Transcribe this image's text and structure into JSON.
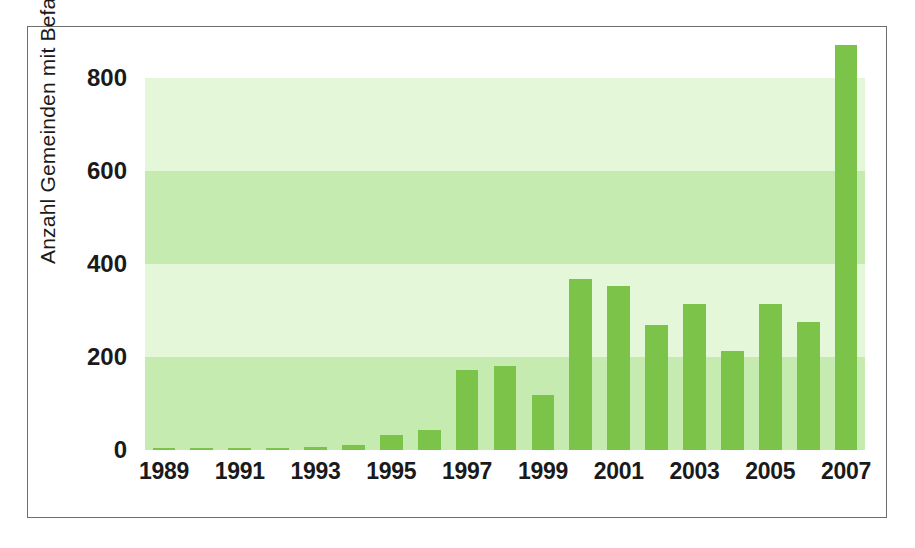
{
  "chart_data": {
    "type": "bar",
    "title": "",
    "subtitle": "",
    "xlabel": "",
    "ylabel": "Anzahl Gemeinden mit Befall",
    "categories": [
      "1989",
      "1990",
      "1991",
      "1992",
      "1993",
      "1994",
      "1995",
      "1996",
      "1997",
      "1998",
      "1999",
      "2000",
      "2001",
      "2002",
      "2003",
      "2004",
      "2005",
      "2006",
      "2007"
    ],
    "values": [
      5,
      5,
      5,
      5,
      6,
      10,
      32,
      43,
      172,
      180,
      118,
      367,
      353,
      268,
      313,
      214,
      315,
      275,
      872
    ],
    "ylim": [
      0,
      900
    ],
    "yticks": [
      0,
      200,
      400,
      600,
      800
    ],
    "ytick_labels": [
      "0",
      "200",
      "400",
      "600",
      "800"
    ],
    "xtick_labels": [
      "1989",
      "1991",
      "1993",
      "1995",
      "1997",
      "1999",
      "2001",
      "2003",
      "2005",
      "2007"
    ],
    "grid": "horizontal-bands",
    "legend": "none",
    "bar_color": "#7cc34a",
    "band_color_light": "#e4f7d9",
    "band_color_dark": "#c6ebb0",
    "frame_color": "#6e6e6e",
    "background": "#ffffff",
    "bands": [
      {
        "from": 0,
        "to": 200,
        "shade": "dark"
      },
      {
        "from": 200,
        "to": 400,
        "shade": "light"
      },
      {
        "from": 400,
        "to": 600,
        "shade": "dark"
      },
      {
        "from": 600,
        "to": 800,
        "shade": "light"
      }
    ]
  }
}
